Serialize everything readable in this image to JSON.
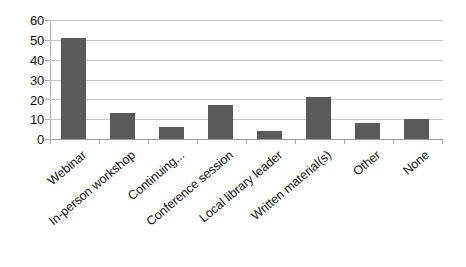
{
  "chart_data": {
    "type": "bar",
    "title": "",
    "subtitle": "",
    "xlabel": "",
    "ylabel": "",
    "categories": [
      "Webinar",
      "In-person workshop",
      "Continuing...",
      "Conference session",
      "Local library leader",
      "Written material(s)",
      "Other",
      "None"
    ],
    "values": [
      51,
      13,
      6,
      17,
      4,
      21,
      8,
      10
    ],
    "ylim": [
      0,
      60
    ],
    "yticks": [
      0,
      10,
      20,
      30,
      40,
      50,
      60
    ],
    "ytick_labels": [
      "0",
      "10",
      "20",
      "30",
      "40",
      "50",
      "60"
    ],
    "grid": true,
    "grid_axis": "y",
    "legend": false,
    "legend_position": "none",
    "series": [
      {
        "name": "Responses",
        "values": [
          51,
          13,
          6,
          17,
          4,
          21,
          8,
          10
        ]
      }
    ],
    "annotations": []
  },
  "style": {
    "bar_color": "#595959",
    "grid_color": "#c8c8c8",
    "axis_color": "#b0b0b0",
    "text_color": "#121212",
    "background": "#ffffff"
  }
}
